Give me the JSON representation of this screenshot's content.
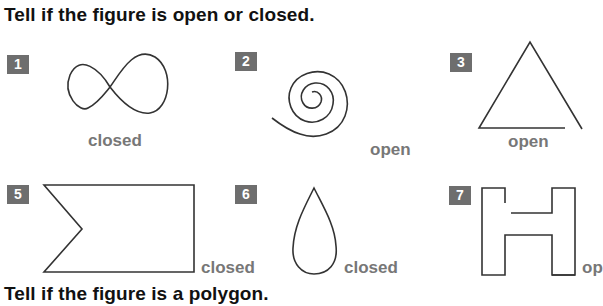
{
  "headings": {
    "open_closed": "Tell if the figure is open or closed.",
    "polygon": "Tell if the figure is a polygon."
  },
  "problems": [
    {
      "number": "1",
      "figure": "figure-eight-icon",
      "answer": "closed"
    },
    {
      "number": "2",
      "figure": "spiral-icon",
      "answer": "open"
    },
    {
      "number": "3",
      "figure": "open-triangle-icon",
      "answer": "open"
    },
    {
      "number": "5",
      "figure": "notched-pentagon-icon",
      "answer": "closed"
    },
    {
      "number": "6",
      "figure": "teardrop-icon",
      "answer": "closed"
    },
    {
      "number": "7",
      "figure": "open-h-shape-icon",
      "answer": "op"
    }
  ],
  "colors": {
    "badge": "#6e6e6e",
    "answer_text": "#777777",
    "heading_text": "#111111"
  }
}
